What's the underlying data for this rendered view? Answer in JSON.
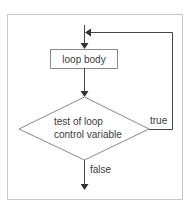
{
  "diagram": {
    "type": "flowchart",
    "title": "",
    "nodes": [
      {
        "id": "loop_body",
        "shape": "rectangle",
        "label": "loop body"
      },
      {
        "id": "test",
        "shape": "diamond",
        "label_lines": [
          "test of loop",
          "control variable"
        ]
      }
    ],
    "edges": [
      {
        "from": "entry",
        "to": "loop_body",
        "label": ""
      },
      {
        "from": "loop_body",
        "to": "test",
        "label": ""
      },
      {
        "from": "test",
        "to": "loop_body",
        "label": "true"
      },
      {
        "from": "test",
        "to": "exit",
        "label": "false"
      }
    ],
    "labels": {
      "loop_body": "loop body",
      "test_line1": "test of loop",
      "test_line2": "control variable",
      "true_label": "true",
      "false_label": "false"
    },
    "colors": {
      "frame": "#c8c8c8",
      "line": "#555555",
      "shape_stroke": "#8a8a8a",
      "text": "#3a3a3a"
    }
  }
}
